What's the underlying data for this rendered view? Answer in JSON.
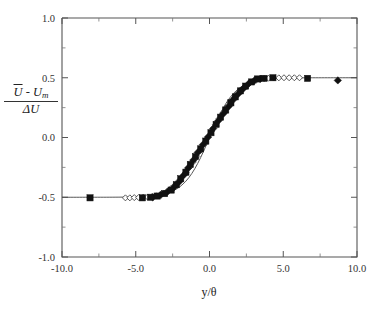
{
  "figure": {
    "background_color": "#ffffff",
    "axis_color": "#555555",
    "marker_color": "#111111",
    "line_color": "#444444"
  },
  "axis_labels": {
    "x_title": "y/θ",
    "y_numerator_u": "U",
    "y_numerator_minus": " - ",
    "y_numerator_um": "U",
    "y_numerator_um_sub": "m",
    "y_denominator_delta": "ΔU"
  },
  "chart_data": {
    "type": "scatter",
    "title": "",
    "xlabel": "y/θ",
    "ylabel": "(Ū - U_m)/ΔU",
    "xlim": [
      -10.0,
      10.0
    ],
    "ylim": [
      -1.0,
      1.0
    ],
    "grid": false,
    "legend": "none",
    "x_ticks": [
      -10.0,
      -5.0,
      0.0,
      5.0,
      10.0
    ],
    "x_tick_labels": [
      "-10.0",
      "-5.0",
      "0.0",
      "5.0",
      "10.0"
    ],
    "x_minor_ticks": [
      -7.5,
      -2.5,
      2.5,
      7.5
    ],
    "y_ticks": [
      1.0,
      0.5,
      0.0,
      -0.5,
      -1.0
    ],
    "y_tick_labels": [
      "1.0",
      "0.5",
      "0.0",
      "-0.5",
      "-1.0"
    ],
    "y_minor_ticks": [
      0.75,
      0.25,
      -0.25,
      -0.75
    ],
    "series": [
      {
        "name": "filled-square",
        "marker": "filled-square",
        "points": [
          [
            -8.1,
            -0.505
          ],
          [
            -4.55,
            -0.505
          ],
          [
            -4.0,
            -0.5
          ],
          [
            -3.55,
            -0.49
          ],
          [
            -3.05,
            -0.47
          ],
          [
            -2.6,
            -0.44
          ],
          [
            -2.25,
            -0.395
          ],
          [
            -1.95,
            -0.345
          ],
          [
            -1.6,
            -0.29
          ],
          [
            -1.3,
            -0.225
          ],
          [
            -0.95,
            -0.16
          ],
          [
            -0.6,
            -0.095
          ],
          [
            -0.25,
            -0.03
          ],
          [
            0.1,
            0.04
          ],
          [
            0.45,
            0.11
          ],
          [
            0.75,
            0.17
          ],
          [
            1.1,
            0.23
          ],
          [
            1.45,
            0.29
          ],
          [
            1.75,
            0.34
          ],
          [
            2.1,
            0.39
          ],
          [
            2.45,
            0.43
          ],
          [
            2.85,
            0.465
          ],
          [
            3.25,
            0.49
          ],
          [
            3.7,
            0.495
          ],
          [
            4.3,
            0.5
          ],
          [
            6.65,
            0.495
          ]
        ]
      },
      {
        "name": "filled-diamond",
        "marker": "filled-diamond",
        "points": [
          [
            -3.85,
            -0.5
          ],
          [
            -3.3,
            -0.48
          ],
          [
            -2.85,
            -0.455
          ],
          [
            -2.4,
            -0.415
          ],
          [
            -2.05,
            -0.37
          ],
          [
            -1.75,
            -0.315
          ],
          [
            -1.45,
            -0.255
          ],
          [
            -1.1,
            -0.19
          ],
          [
            -0.8,
            -0.125
          ],
          [
            -0.45,
            -0.06
          ],
          [
            -0.1,
            0.005
          ],
          [
            0.25,
            0.075
          ],
          [
            0.6,
            0.14
          ],
          [
            0.95,
            0.2
          ],
          [
            1.3,
            0.26
          ],
          [
            1.6,
            0.315
          ],
          [
            1.95,
            0.365
          ],
          [
            2.3,
            0.41
          ],
          [
            2.65,
            0.45
          ],
          [
            3.05,
            0.478
          ],
          [
            3.45,
            0.492
          ],
          [
            8.7,
            0.478
          ]
        ]
      },
      {
        "name": "open-diamond",
        "marker": "open-diamond",
        "points": [
          [
            -5.7,
            -0.505
          ],
          [
            -5.4,
            -0.505
          ],
          [
            -5.1,
            -0.503
          ],
          [
            -4.8,
            -0.502
          ],
          [
            -4.5,
            -0.5
          ],
          [
            -4.2,
            -0.498
          ],
          [
            -3.9,
            -0.495
          ],
          [
            -3.6,
            -0.488
          ],
          [
            -3.35,
            -0.478
          ],
          [
            -3.1,
            -0.465
          ],
          [
            -2.85,
            -0.448
          ],
          [
            -2.6,
            -0.425
          ],
          [
            -2.35,
            -0.398
          ],
          [
            -2.1,
            -0.365
          ],
          [
            -1.85,
            -0.33
          ],
          [
            -1.6,
            -0.292
          ],
          [
            -1.35,
            -0.25
          ],
          [
            -1.1,
            -0.205
          ],
          [
            -0.85,
            -0.158
          ],
          [
            -0.6,
            -0.108
          ],
          [
            -0.35,
            -0.055
          ],
          [
            -0.1,
            0.0
          ],
          [
            0.15,
            0.055
          ],
          [
            0.4,
            0.108
          ],
          [
            0.65,
            0.158
          ],
          [
            0.9,
            0.205
          ],
          [
            1.15,
            0.25
          ],
          [
            1.4,
            0.292
          ],
          [
            1.65,
            0.33
          ],
          [
            1.9,
            0.365
          ],
          [
            2.15,
            0.398
          ],
          [
            2.4,
            0.425
          ],
          [
            2.65,
            0.448
          ],
          [
            2.9,
            0.465
          ],
          [
            3.15,
            0.478
          ],
          [
            3.4,
            0.487
          ],
          [
            3.7,
            0.493
          ],
          [
            4.0,
            0.496
          ],
          [
            4.35,
            0.498
          ],
          [
            4.7,
            0.499
          ],
          [
            5.05,
            0.5
          ],
          [
            5.4,
            0.5
          ],
          [
            5.75,
            0.5
          ],
          [
            6.1,
            0.5
          ]
        ]
      }
    ],
    "fit_curve": {
      "name": "tanh-fit",
      "style": "solid-thin",
      "description": "smooth sigmoid through data from -10 to 10"
    }
  }
}
